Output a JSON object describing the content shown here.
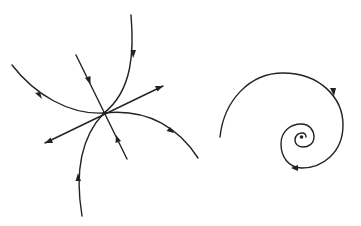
{
  "figure": {
    "background": "#ffffff",
    "stroke_color": "#222222",
    "panels": [
      {
        "id": "node",
        "description": "Phase portrait: trajectories converging/diverging at a critical point with two straight-line eigen-directions",
        "critical_point": [
          104,
          113
        ]
      },
      {
        "id": "spiral",
        "description": "Phase portrait: spiral trajectory winding into a stable focus",
        "critical_point": [
          301,
          137
        ]
      }
    ]
  }
}
